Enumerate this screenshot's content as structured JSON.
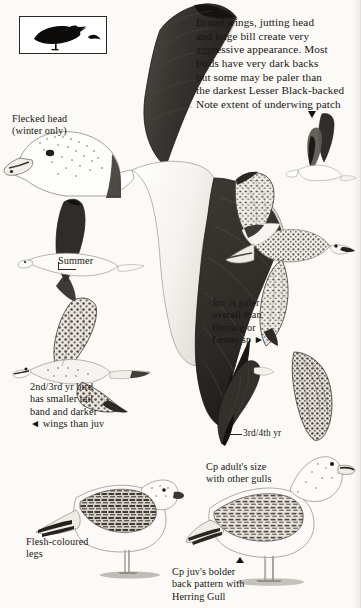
{
  "plate": {
    "subject": "Great Black-backed Gull",
    "background_color": "#fbfaf7",
    "ink_color": "#181512",
    "width": 360,
    "height": 608
  },
  "silhouette_box": {
    "name": "silhouette-comparison-box",
    "description": "standing dark gull with small flying bird"
  },
  "captions": {
    "main_note": "Broad wings, jutting head\nand huge bill create very\naggressive appearance. Most\nbirds have very dark backs\nbut some may be paler than\nthe darkest Lesser Black-backed",
    "underwing_note": "Note extent of underwing patch",
    "flecked_head": "Flecked head\n(winter only)",
    "summer": "Summer",
    "second_third_year": "2nd/3rd yr bird\nhas smaller tail\nband and darker\n◄ wings than juv",
    "juv_paler": "Juv is paler\noverall than\nHerring or\nLesser sp ►",
    "third_fourth_year": "3rd/4th yr",
    "compare_adult_size": "Cp adult's size\nwith other gulls",
    "flesh_legs": "Flesh-coloured\nlegs",
    "compare_juv_back": "Cp juv's bolder\nback pattern with\nHerring Gull"
  },
  "figures": [
    {
      "name": "adult-upperwing-flight",
      "label": "large adult in flight from above, very dark back and wings"
    },
    {
      "name": "adult-head-profile",
      "label": "adult head in profile with winter flecking"
    },
    {
      "name": "adult-summer-flight",
      "label": "summer adult in flight, dark upperparts"
    },
    {
      "name": "underwing-patch-bird",
      "label": "small bird showing underwing patch extent"
    },
    {
      "name": "juvenile-flight-upper",
      "label": "juvenile in flight, mottled pale plumage"
    },
    {
      "name": "second-third-year-flight",
      "label": "2nd/3rd year bird in flight"
    },
    {
      "name": "third-fourth-year-flight",
      "label": "3rd/4th year bird in flight, dark wings"
    },
    {
      "name": "juvenile-standing-left",
      "label": "juvenile standing, flesh-coloured legs"
    },
    {
      "name": "juvenile-standing-right",
      "label": "juvenile Herring Gull standing for comparison"
    }
  ]
}
